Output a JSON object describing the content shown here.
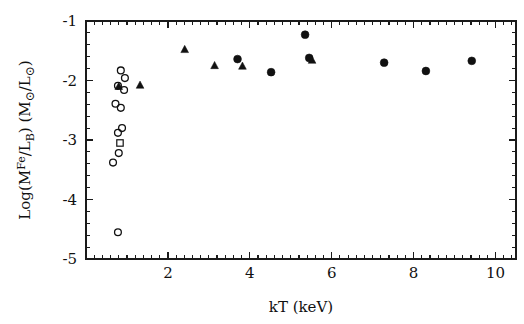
{
  "chart_data": {
    "type": "scatter",
    "title": "",
    "xlabel": "kT (keV)",
    "ylabel": "Log(M^Fe/L_B) (M_sun/L_sun)",
    "ylabel_parts": {
      "log_open": "Log(M",
      "sup_fe": "Fe",
      "slash_lb_open": "/L",
      "sub_b": "B",
      "close_paren": ")",
      "units_open": " (M",
      "sun1": "⊙",
      "units_slash": "/L",
      "sun2": "⊙",
      "units_close": ")"
    },
    "xlim": [
      0.0,
      10.5
    ],
    "ylim": [
      -5.0,
      -1.0
    ],
    "xticks": [
      2,
      4,
      6,
      8,
      10
    ],
    "xticklabels": [
      "2",
      "4",
      "6",
      "8",
      "10"
    ],
    "yticks": [
      -1,
      -2,
      -3,
      -4,
      -5
    ],
    "yticklabels": [
      "-1",
      "-2",
      "-3",
      "-4",
      "-5"
    ],
    "x_minor_step": 0.2,
    "y_minor_step": 0.2,
    "grid": false,
    "legend": "none",
    "ticks_direction": "inward",
    "series": [
      {
        "name": "open circles",
        "marker": "open-circle",
        "points": [
          {
            "x": 0.85,
            "y": -1.83
          },
          {
            "x": 0.95,
            "y": -1.96
          },
          {
            "x": 0.78,
            "y": -2.09
          },
          {
            "x": 0.93,
            "y": -2.16
          },
          {
            "x": 0.72,
            "y": -2.39
          },
          {
            "x": 0.85,
            "y": -2.46
          },
          {
            "x": 0.78,
            "y": -2.88
          },
          {
            "x": 0.88,
            "y": -2.8
          },
          {
            "x": 0.8,
            "y": -3.22
          },
          {
            "x": 0.66,
            "y": -3.38
          },
          {
            "x": 0.78,
            "y": -4.55
          }
        ]
      },
      {
        "name": "open squares",
        "marker": "open-square",
        "points": [
          {
            "x": 0.83,
            "y": -3.05
          }
        ]
      },
      {
        "name": "filled triangles",
        "marker": "filled-triangle",
        "points": [
          {
            "x": 0.8,
            "y": -2.1
          },
          {
            "x": 1.32,
            "y": -2.08
          },
          {
            "x": 2.41,
            "y": -1.48
          },
          {
            "x": 3.14,
            "y": -1.75
          },
          {
            "x": 3.82,
            "y": -1.76
          },
          {
            "x": 5.52,
            "y": -1.66
          }
        ]
      },
      {
        "name": "filled circles",
        "marker": "filled-circle",
        "points": [
          {
            "x": 3.7,
            "y": -1.64
          },
          {
            "x": 4.52,
            "y": -1.86
          },
          {
            "x": 5.35,
            "y": -1.23
          },
          {
            "x": 5.45,
            "y": -1.62
          },
          {
            "x": 7.28,
            "y": -1.7
          },
          {
            "x": 8.3,
            "y": -1.84
          },
          {
            "x": 9.42,
            "y": -1.67
          }
        ]
      }
    ]
  },
  "figure": {
    "plot_area": {
      "left": 86,
      "top": 21,
      "right": 516,
      "bottom": 259
    }
  }
}
